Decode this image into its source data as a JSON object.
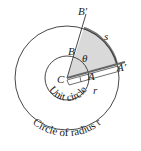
{
  "labels": {
    "B_prime": "B′",
    "B": "B",
    "s": "s",
    "theta": "θ",
    "A_prime": "A′",
    "C": "C",
    "A": "A",
    "r": "r",
    "unit_circle": "Unit circle",
    "circle_radius": "Circle of radius r"
  },
  "colors": {
    "sector_fill": "#d9d9d9",
    "line": "#333333",
    "arc": "#777777"
  }
}
